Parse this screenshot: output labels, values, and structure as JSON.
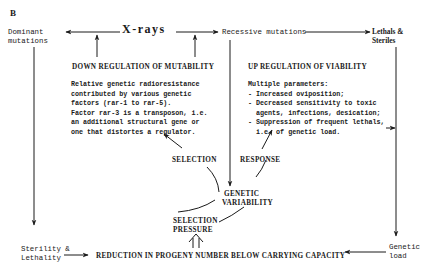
{
  "panel_label": "B",
  "nodes": {
    "dominant_mutations": [
      "Dominant",
      "mutations"
    ],
    "xrays": "X-rays",
    "recessive_mutations": "Recessive mutations",
    "lethals_sterILES": [
      "Lethals &",
      "Steriles"
    ],
    "sterility_lethality": [
      "Sterility &",
      "Lethality"
    ],
    "genetic_load": [
      "Genetic",
      "load"
    ],
    "reduction": "REDUCTION IN PROGENY NUMBER BELOW CARRYING CAPACITY",
    "genetic_variability": [
      "GENETIC",
      "VARIABILITY"
    ],
    "selection_pressure": [
      "SELECTION",
      "PRESSURE"
    ],
    "selection": "SELECTION",
    "response": "RESPONSE"
  },
  "down_regulation": {
    "title": "DOWN REGULATION OF MUTABILITY",
    "lines": [
      "Relative genetic radioresistance",
      "contributed by various genetic",
      "factors (rar-1 to rar-5).",
      "Factor rar-3 is a transposon, i.e.",
      "an additional structural gene or",
      "one that distortes a regulator."
    ]
  },
  "up_regulation": {
    "title": "UP REGULATION OF VIABILITY",
    "lines": [
      "Multiple parameters:",
      "- Increased oviposition;",
      "- Decreased sensitivity to toxic",
      "  agents, infections, desication;",
      "- Suppression of frequent lethals,",
      "  i.e. of genetic load."
    ]
  },
  "colors": {
    "ink": "#1a1a1a",
    "background": "#ffffff"
  }
}
